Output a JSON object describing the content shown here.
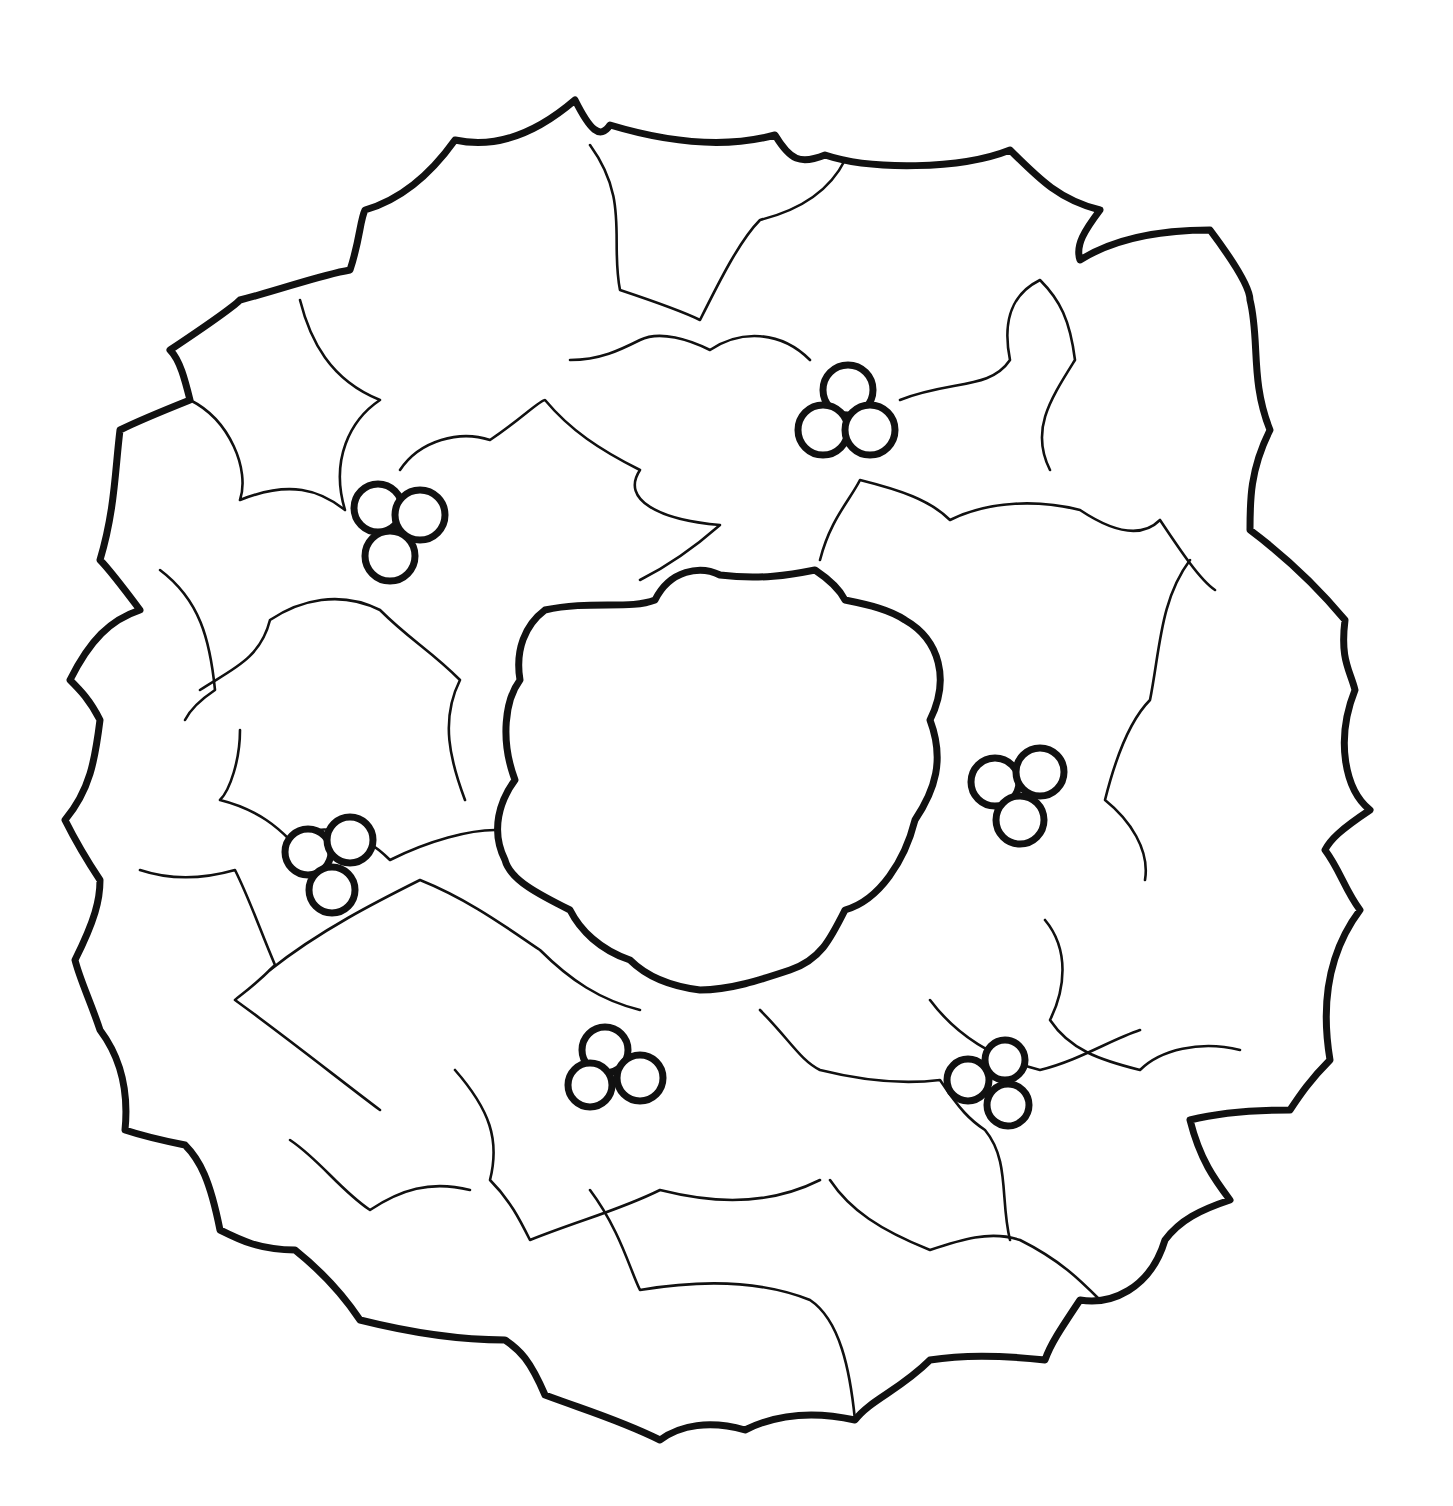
{
  "image": {
    "subject": "holly wreath coloring page",
    "style": "black line art on white",
    "colors": {
      "background": "#ffffff",
      "ink": "#111111"
    },
    "wreath": {
      "center": [
        725,
        780
      ],
      "outer_radius": 640,
      "inner_radius": 210
    },
    "berry_clusters": [
      {
        "name": "upper-left",
        "center": [
          395,
          530
        ]
      },
      {
        "name": "top-right",
        "center": [
          850,
          410
        ]
      },
      {
        "name": "right",
        "center": [
          1015,
          790
        ]
      },
      {
        "name": "left",
        "center": [
          325,
          865
        ]
      },
      {
        "name": "bottom-center",
        "center": [
          615,
          1065
        ]
      },
      {
        "name": "bottom-right",
        "center": [
          985,
          1085
        ]
      }
    ]
  }
}
